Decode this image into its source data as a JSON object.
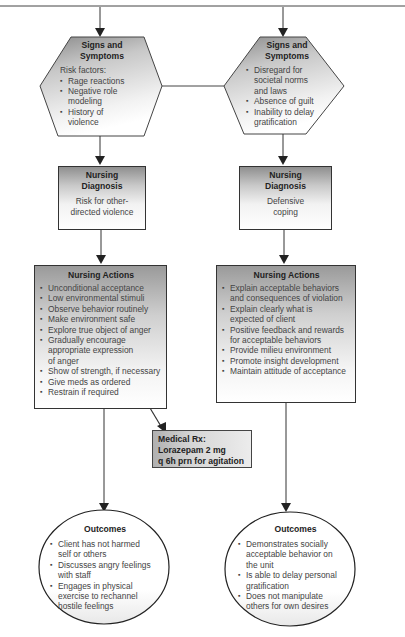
{
  "header": {
    "caption_partial": "(cropped caption at top edge)"
  },
  "left": {
    "signs": {
      "title": "Signs and Symptoms",
      "title_line1": "Signs and",
      "title_line2": "Symptoms",
      "subtitle": "Risk factors:",
      "items": [
        "Rage reactions",
        "Negative role modeling",
        "History of violence"
      ]
    },
    "diagnosis": {
      "title_line1": "Nursing",
      "title_line2": "Diagnosis",
      "text_line1": "Risk for other-",
      "text_line2": "directed violence"
    },
    "actions": {
      "title": "Nursing Actions",
      "items": [
        "Unconditional acceptance",
        "Low environmental stimuli",
        "Observe behavior routinely",
        "Make environment safe",
        "Explore true object of anger",
        "Gradually encourage appropriate expression of anger",
        "Show of strength, if necessary",
        "Give meds as ordered",
        "Restrain if required"
      ]
    },
    "outcomes": {
      "title": "Outcomes",
      "items": [
        "Client has not harmed self or others",
        "Discusses angry feelings with staff",
        "Engages in physical exercise to rechannel hostile feelings"
      ]
    }
  },
  "right": {
    "signs": {
      "title_line1": "Signs and",
      "title_line2": "Symptoms",
      "items": [
        "Disregard for societal norms and laws",
        "Absence of guilt",
        "Inability to delay gratification"
      ]
    },
    "diagnosis": {
      "title_line1": "Nursing",
      "title_line2": "Diagnosis",
      "text_line1": "Defensive",
      "text_line2": "coping"
    },
    "actions": {
      "title": "Nursing Actions",
      "items": [
        "Explain acceptable behaviors and consequences of violation",
        "Explain clearly what is expected of client",
        "Positive feedback and rewards for acceptable behaviors",
        "Provide milieu environment",
        "Promote insight development",
        "Maintain attitude of acceptance"
      ]
    },
    "outcomes": {
      "title": "Outcomes",
      "items": [
        "Demonstrates socially acceptable behavior on the unit",
        "Is able to delay personal gratification",
        "Does not manipulate others for own desires"
      ]
    }
  },
  "medical_rx": {
    "line1": "Medical Rx:",
    "line2": "Lorazepam 2 mg",
    "line3": "q 6h prn for agitation"
  }
}
